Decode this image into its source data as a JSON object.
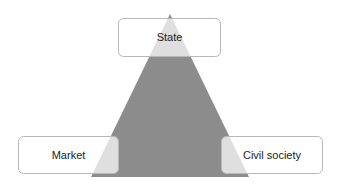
{
  "diagram": {
    "type": "triangle",
    "colors": {
      "triangle_fill": "#8c8c8c",
      "box_fill": "rgba(255,255,255,0.72)",
      "box_border": "#b8b8b8"
    },
    "nodes": [
      {
        "id": "state",
        "label": "State",
        "position": "top"
      },
      {
        "id": "market",
        "label": "Market",
        "position": "bottom-left"
      },
      {
        "id": "civil-society",
        "label": "Civil society",
        "position": "bottom-right"
      }
    ]
  }
}
